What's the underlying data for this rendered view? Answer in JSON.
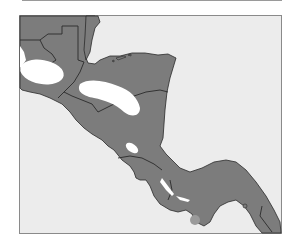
{
  "map": {
    "type": "regional outline map",
    "region": "Central America",
    "colors": {
      "sea": "#ececec",
      "land": "#7c7c7c",
      "border": "#2a2a2a",
      "highlight": "#ffffff",
      "frame": "#8a8a8a",
      "marker": "#9a9a9a"
    },
    "highlighted_zones": [
      "western-guatemala-zone",
      "honduras-zone",
      "nicaragua-lake-zone",
      "costa-rica-zone-1",
      "costa-rica-zone-2"
    ],
    "markers": [
      "offshore-island-dot"
    ]
  }
}
